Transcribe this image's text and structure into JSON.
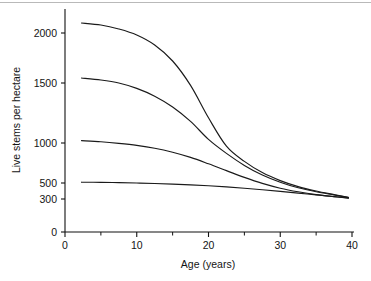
{
  "figure": {
    "background_color": "#ffffff",
    "axis_color": "#111111",
    "curve_color": "#1a1a1a",
    "top_rule_color": "#b9b9b9"
  },
  "chart_data": {
    "type": "line",
    "title": "",
    "subtitle": "",
    "xlabel": "Age (years)",
    "ylabel": "Live stems per hectare",
    "xlim": [
      0,
      40
    ],
    "ylim": [
      0,
      2200
    ],
    "grid": false,
    "legend": null,
    "legend_position": "none",
    "x_ticks": [
      0,
      10,
      20,
      30,
      40
    ],
    "x_tick_labels": [
      "0",
      "10",
      "20",
      "30",
      "40"
    ],
    "x_minor_ticks": [
      5,
      15,
      25,
      35
    ],
    "y_ticks": [
      0,
      300,
      500,
      1000,
      1500,
      2000
    ],
    "y_tick_labels": [
      "0",
      "300",
      "500",
      "1000",
      "1500",
      "2000"
    ],
    "y_axis_note": "non-linear spacing below 500; 0 tick compressed toward axis base",
    "x": [
      2.3,
      5,
      7.5,
      10,
      12.5,
      15,
      17.5,
      20,
      22.5,
      25,
      27.5,
      30,
      32.5,
      35,
      37.5,
      39.5
    ],
    "series": [
      {
        "name": "initial density 2100",
        "values": [
          2100,
          2080,
          2040,
          1980,
          1880,
          1720,
          1480,
          1210,
          960,
          770,
          630,
          530,
          455,
          400,
          355,
          320
        ]
      },
      {
        "name": "initial density 1550",
        "values": [
          1550,
          1530,
          1500,
          1455,
          1390,
          1300,
          1180,
          1030,
          870,
          720,
          600,
          510,
          440,
          390,
          350,
          318
        ]
      },
      {
        "name": "initial density 1020",
        "values": [
          1020,
          1010,
          995,
          970,
          935,
          885,
          820,
          740,
          655,
          570,
          495,
          435,
          390,
          355,
          330,
          312
        ]
      },
      {
        "name": "initial density 510",
        "values": [
          510,
          508,
          505,
          500,
          494,
          486,
          477,
          466,
          452,
          435,
          416,
          396,
          374,
          352,
          330,
          310
        ]
      }
    ]
  }
}
